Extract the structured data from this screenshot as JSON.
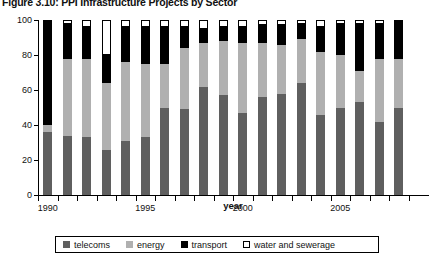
{
  "chart_data": {
    "type": "bar",
    "stacked": true,
    "stack_total": 100,
    "title": "Figure 3.10: PPI Infrastructure Projects by Sector",
    "xlabel": "year",
    "ylabel": "percent",
    "ylim": [
      0,
      100
    ],
    "yticks": [
      0,
      20,
      40,
      60,
      80,
      100
    ],
    "ytick_labels": [
      "0",
      "20",
      "40",
      "60",
      "80",
      "100"
    ],
    "grid": false,
    "legend_position": "bottom",
    "categories": [
      "1990",
      "1991",
      "1992",
      "1993",
      "1994",
      "1995",
      "1996",
      "1997",
      "1998",
      "1999",
      "2000",
      "2001",
      "2002",
      "2003",
      "2004",
      "2005",
      "2006",
      "2007",
      "2008"
    ],
    "xtick_labels": [
      "1990",
      "",
      "",
      "",
      "",
      "1995",
      "",
      "",
      "",
      "",
      "2000",
      "",
      "",
      "",
      "",
      "2005",
      "",
      "",
      ""
    ],
    "colors": {
      "telecoms": "#5f5f5f",
      "energy": "#b0b0b0",
      "transport": "#000000",
      "water and sewerage": "#ffffff"
    },
    "series": [
      {
        "name": "telecoms",
        "values": [
          36,
          34,
          33,
          26,
          31,
          33,
          50,
          49,
          62,
          57,
          47,
          56,
          58,
          64,
          46,
          50,
          53,
          42,
          50
        ]
      },
      {
        "name": "energy",
        "values": [
          4,
          44,
          45,
          38,
          45,
          42,
          25,
          35,
          25,
          31,
          40,
          31,
          28,
          25,
          36,
          30,
          18,
          36,
          28
        ]
      },
      {
        "name": "transport",
        "values": [
          60,
          20,
          18,
          16,
          20,
          21,
          21,
          12,
          8,
          8,
          9,
          10,
          11,
          9,
          14,
          18,
          27,
          20,
          22
        ]
      },
      {
        "name": "water and sewerage",
        "values": [
          0,
          2,
          4,
          20,
          4,
          4,
          4,
          4,
          5,
          4,
          4,
          3,
          3,
          2,
          4,
          2,
          2,
          2,
          0
        ]
      }
    ]
  },
  "legend": {
    "items": [
      {
        "label": "telecoms",
        "swatch": "telecoms-swatch"
      },
      {
        "label": "energy",
        "swatch": "energy-swatch"
      },
      {
        "label": "transport",
        "swatch": "transport-swatch"
      },
      {
        "label": "water and sewerage",
        "swatch": "water-and-sewerage-swatch"
      }
    ]
  }
}
